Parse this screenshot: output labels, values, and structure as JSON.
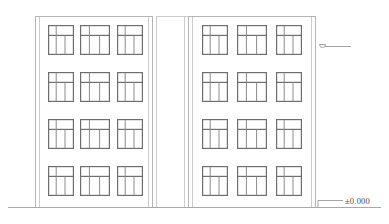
{
  "drawing": {
    "type": "building-elevation",
    "title": "Building Elevation",
    "background_color": "#ffffff",
    "line_color": "#8c8c8c",
    "wall_line_color": "#b5b5b5",
    "window_frame_color": "#6e6e6e",
    "window_mullion_color": "#8a8a8a",
    "ground_line_color": "#a9a9a9",
    "text_color": "#4a4a4a"
  },
  "annotations": {
    "datum_label": "±0.000",
    "datum_leader_note": "leader-line-to-ground",
    "level_marker_note": "level-symbol"
  },
  "blocks": [
    {
      "name": "left-block",
      "x": 35,
      "width": 117,
      "top": 16,
      "bottom": 207,
      "floors": 4,
      "windows_per_floor": 3
    },
    {
      "name": "right-block",
      "x": 188,
      "width": 127,
      "top": 16,
      "bottom": 207,
      "floors": 4,
      "windows_per_floor": 3
    }
  ],
  "window": {
    "upper_panes": 2,
    "lower_panes": 3,
    "transom_ratio": 0.34
  },
  "ground": {
    "y": 207,
    "x_start": 8,
    "x_end": 381
  },
  "level_marker": {
    "x": 322,
    "y": 46,
    "leader_length": 26
  }
}
